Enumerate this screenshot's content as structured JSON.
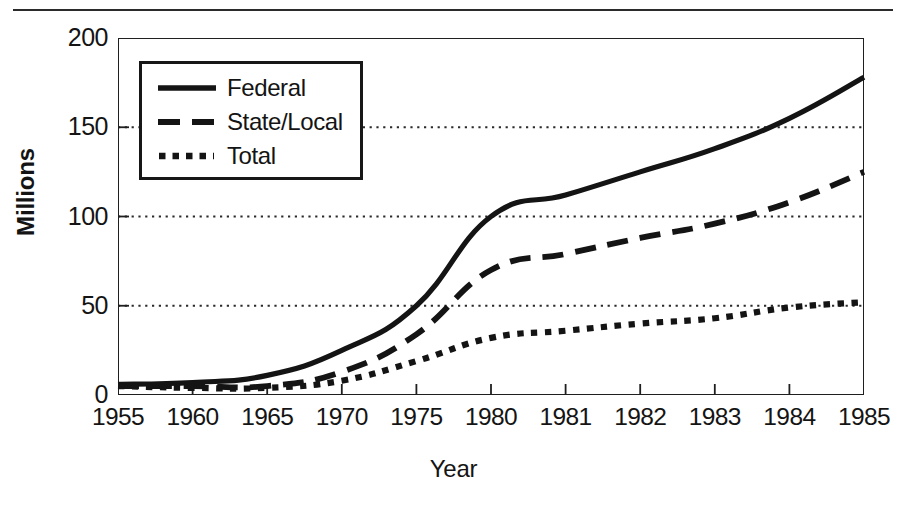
{
  "chart_data": {
    "type": "line",
    "title": "",
    "xlabel": "Year",
    "ylabel": "Millions",
    "categories": [
      "1955",
      "1960",
      "1965",
      "1970",
      "1975",
      "1980",
      "1981",
      "1982",
      "1983",
      "1984",
      "1985"
    ],
    "x_tick_labels": [
      "1955",
      "1960",
      "1965",
      "1970",
      "1975",
      "1980",
      "1981",
      "1982",
      "1983",
      "1984",
      "1985"
    ],
    "y_tick_labels": [
      "0",
      "50",
      "100",
      "150",
      "200"
    ],
    "y_ticks": [
      0,
      50,
      100,
      150,
      200
    ],
    "ylim": [
      0,
      200
    ],
    "grid": "horizontal-dotted-at-50-100-150",
    "legend_position": "top-left-inside",
    "series": [
      {
        "name": "Federal",
        "style": "solid",
        "values": [
          6,
          7,
          11,
          25,
          50,
          100,
          112,
          125,
          138,
          155,
          178
        ]
      },
      {
        "name": "State/Local",
        "style": "dashed",
        "values": [
          5,
          5,
          5,
          13,
          34,
          70,
          79,
          88,
          96,
          108,
          125
        ]
      },
      {
        "name": "Total",
        "style": "dotted",
        "values": [
          5,
          4,
          4,
          8,
          19,
          32,
          36,
          40,
          43,
          49,
          52
        ]
      }
    ]
  },
  "legend": {
    "items": [
      {
        "label": "Federal",
        "sample": "solid-line-sample-icon"
      },
      {
        "label": "State/Local",
        "sample": "dashed-line-sample-icon"
      },
      {
        "label": "Total",
        "sample": "dotted-line-sample-icon"
      }
    ]
  },
  "colors": {
    "line": "#141414",
    "grid": "#2a2a2a",
    "frame": "#1f1f1f",
    "background": "#ffffff"
  }
}
